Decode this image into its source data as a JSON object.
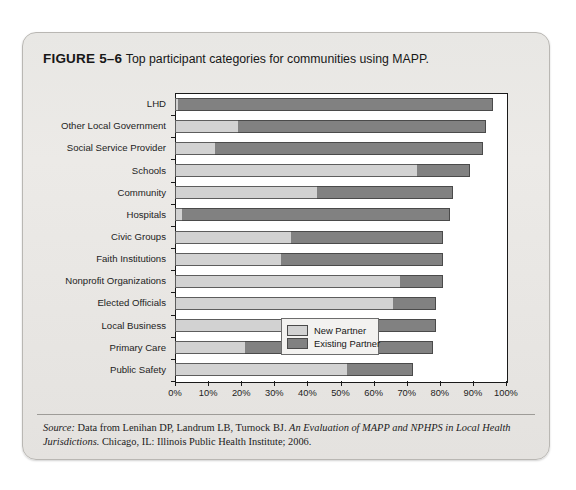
{
  "figure": {
    "label": "FIGURE 5–6",
    "caption": "Top participant categories for communities using MAPP.",
    "source_word": "Source:",
    "source_text_1": " Data from Lenihan DP, Landrum LB, Turnock BJ. ",
    "source_title": "An Evaluation of MAPP and NPHPS in Local Health Jurisdictions.",
    "source_text_2": " Chicago, IL: Illinois Public Health Institute; 2006."
  },
  "colors": {
    "new_partner": "#d2d2d2",
    "existing_partner": "#818181",
    "panel_background": "#e8e7e4",
    "plot_background": "#ffffff",
    "axis": "#1a1a1a"
  },
  "legend": {
    "position": "inside-bottom-right",
    "entries": [
      {
        "label": "New Partner",
        "color": "#d2d2d2"
      },
      {
        "label": "Existing Partner",
        "color": "#818181"
      }
    ]
  },
  "chart_data": {
    "type": "bar",
    "orientation": "horizontal",
    "stacked": true,
    "title": "Top participant categories for communities using MAPP.",
    "xlabel": "",
    "ylabel": "",
    "xlim": [
      0,
      100
    ],
    "xticks": [
      0,
      10,
      20,
      30,
      40,
      50,
      60,
      70,
      80,
      90,
      100
    ],
    "xticklabels": [
      "0%",
      "10%",
      "20%",
      "30%",
      "40%",
      "50%",
      "60%",
      "70%",
      "80%",
      "90%",
      "100%"
    ],
    "grid": false,
    "legend_position": "inside-bottom-right",
    "categories": [
      "LHD",
      "Other Local Government",
      "Social Service Provider",
      "Schools",
      "Community",
      "Hospitals",
      "Civic Groups",
      "Faith Institutions",
      "Nonprofit Organizations",
      "Elected Officials",
      "Local Business",
      "Primary Care",
      "Public Safety"
    ],
    "series": [
      {
        "name": "New Partner",
        "color": "#d2d2d2",
        "values": [
          1,
          19,
          12,
          73,
          43,
          2,
          35,
          32,
          68,
          66,
          39,
          21,
          52
        ]
      },
      {
        "name": "Existing Partner",
        "color": "#818181",
        "values": [
          95,
          75,
          81,
          16,
          41,
          81,
          46,
          49,
          13,
          13,
          40,
          57,
          20
        ]
      }
    ],
    "totals": [
      96,
      94,
      93,
      89,
      84,
      83,
      81,
      81,
      81,
      79,
      79,
      78,
      72
    ]
  }
}
